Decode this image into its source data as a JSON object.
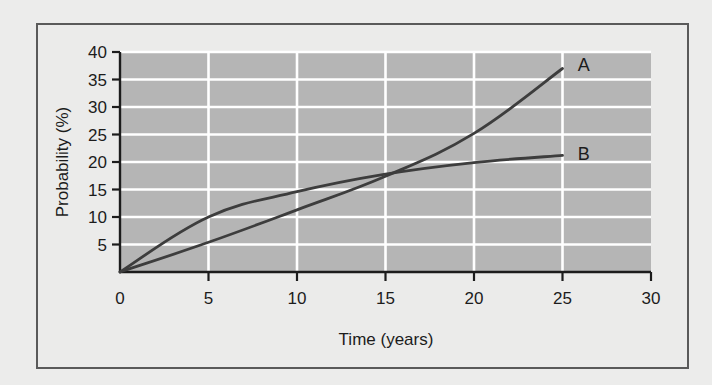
{
  "chart_data": {
    "type": "line",
    "title": "",
    "xlabel": "Time (years)",
    "ylabel": "Probability (%)",
    "xlim": [
      0,
      30
    ],
    "ylim": [
      0,
      40
    ],
    "xticks": [
      0,
      5,
      10,
      15,
      20,
      25,
      30
    ],
    "yticks": [
      0,
      5,
      10,
      15,
      20,
      25,
      30,
      35,
      40
    ],
    "xtick_labels": [
      "0",
      "5",
      "10",
      "15",
      "20",
      "25",
      "30"
    ],
    "ytick_labels": [
      "0",
      "5",
      "10",
      "15",
      "20",
      "25",
      "30",
      "35",
      "40"
    ],
    "grid": true,
    "grid_color": "#ffffff",
    "plot_background": "#b5b5b5",
    "figure_background": "#ebebea",
    "legend_position": "inline-end-of-line",
    "line_color": "#3d3d3d",
    "series": [
      {
        "name": "A",
        "label": "A",
        "color": "#3d3d3d",
        "x": [
          0,
          5,
          10,
          15,
          20,
          25
        ],
        "values": [
          0,
          5.4,
          11.3,
          17.4,
          25.2,
          37.0
        ]
      },
      {
        "name": "B",
        "label": "B",
        "color": "#3d3d3d",
        "x": [
          0,
          5,
          10,
          15,
          20,
          25
        ],
        "values": [
          0,
          10.0,
          14.6,
          17.8,
          19.9,
          21.2
        ]
      }
    ],
    "annotations": [
      {
        "text": "A",
        "x": 26.2,
        "y": 37.6
      },
      {
        "text": "B",
        "x": 26.2,
        "y": 21.4
      }
    ]
  },
  "axes": {
    "x_title": "Time (years)",
    "y_title": "Probability (%)"
  }
}
